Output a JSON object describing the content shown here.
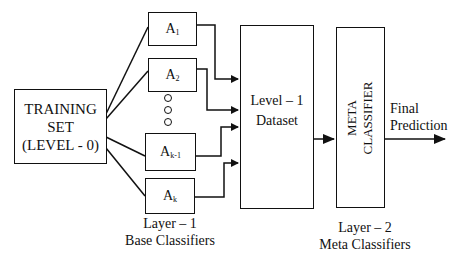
{
  "diagram": {
    "type": "stacking-ensemble-flow",
    "training_set": {
      "line1": "TRAINING",
      "line2": "SET",
      "line3": "(LEVEL - 0)"
    },
    "base_classifiers": [
      {
        "base": "A",
        "sub": "1"
      },
      {
        "base": "A",
        "sub": "2"
      },
      {
        "base": "A",
        "sub": "k-1"
      },
      {
        "base": "A",
        "sub": "k"
      }
    ],
    "ellipsis_dots": 3,
    "level1_dataset": {
      "line1": "Level – 1",
      "line2": "Dataset"
    },
    "meta_classifier": {
      "line1": "META",
      "line2": "CLASSIFIER"
    },
    "output": {
      "line1": "Final",
      "line2": "Prediction"
    },
    "layer1_caption": {
      "line1": "Layer – 1",
      "line2": "Base Classifiers"
    },
    "layer2_caption": {
      "line1": "Layer – 2",
      "line2": "Meta Classifiers"
    },
    "colors": {
      "stroke": "#111111",
      "background": "#ffffff"
    }
  }
}
